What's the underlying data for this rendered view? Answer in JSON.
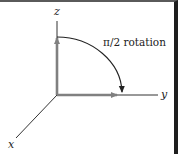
{
  "diagram": {
    "title": "",
    "axes": {
      "x_label": "x",
      "y_label": "y",
      "z_label": "z"
    },
    "annotation": "π/2 rotation",
    "vectors": [
      {
        "name": "z-vector",
        "direction": "z",
        "color": "#808080"
      },
      {
        "name": "y-vector",
        "direction": "y",
        "color": "#808080"
      }
    ],
    "rotation_arc": {
      "from": "z",
      "to": "y",
      "angle": "π/2",
      "color": "#222222"
    },
    "colors": {
      "axis_line": "#333333",
      "vector": "#808080",
      "arc": "#222222",
      "frame_top": "#5a5a5a",
      "frame_right": "#1e1e1e"
    }
  }
}
